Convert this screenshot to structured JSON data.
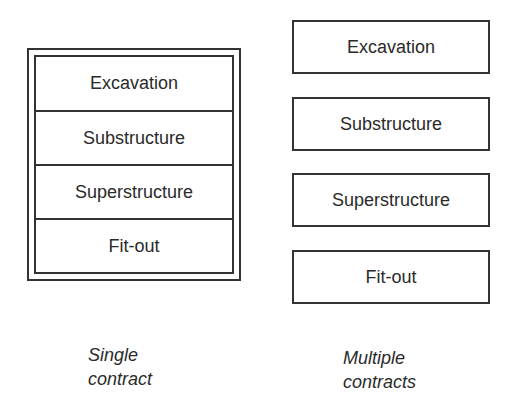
{
  "single_contract": {
    "caption": [
      "Single",
      "contract"
    ],
    "stages": [
      "Excavation",
      "Substructure",
      "Superstructure",
      "Fit-out"
    ]
  },
  "multiple_contracts": {
    "caption": [
      "Multiple",
      "contracts"
    ],
    "stages": [
      "Excavation",
      "Substructure",
      "Superstructure",
      "Fit-out"
    ]
  }
}
